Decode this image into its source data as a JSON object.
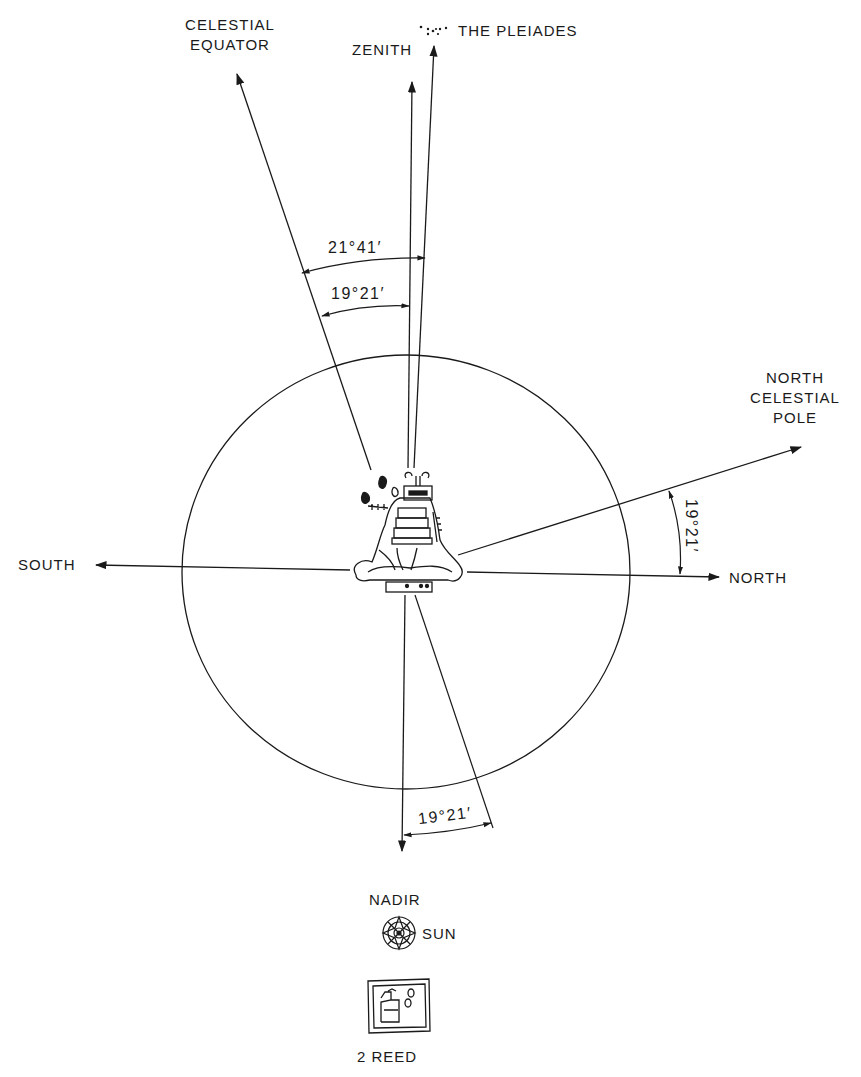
{
  "diagram": {
    "labels": {
      "celestial_equator": [
        "CELESTIAL",
        "EQUATOR"
      ],
      "zenith": "ZENITH",
      "pleiades": "THE PLEIADES",
      "north_celestial_pole": [
        "NORTH",
        "CELESTIAL",
        "POLE"
      ],
      "south": "SOUTH",
      "north": "NORTH",
      "nadir": "NADIR",
      "sun": "SUN",
      "two_reed": "2 REED"
    },
    "angles": {
      "equator_to_pleiades": "21°41′",
      "equator_to_zenith": "19°21′",
      "north_to_pole": "19°21′",
      "nadir_offset": "19°21′"
    },
    "colors": {
      "ink": "#1a1a1a",
      "background": "#ffffff"
    }
  }
}
